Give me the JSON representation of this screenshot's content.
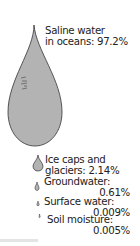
{
  "diagram": {
    "drop_color": "#b3b3b3",
    "outline_color": "#333333",
    "items": [
      {
        "line1": "Saline water",
        "line2": "in oceans: 97.2%"
      },
      {
        "line1": "Ice caps and",
        "line2": "glaciers: 2.14%"
      },
      {
        "line1": "Groundwater:",
        "line2": "0.61%"
      },
      {
        "line1": "Surface water:",
        "line2": "0.009%"
      },
      {
        "line1": "Soil moisture:",
        "line2": "0.005%"
      }
    ]
  }
}
